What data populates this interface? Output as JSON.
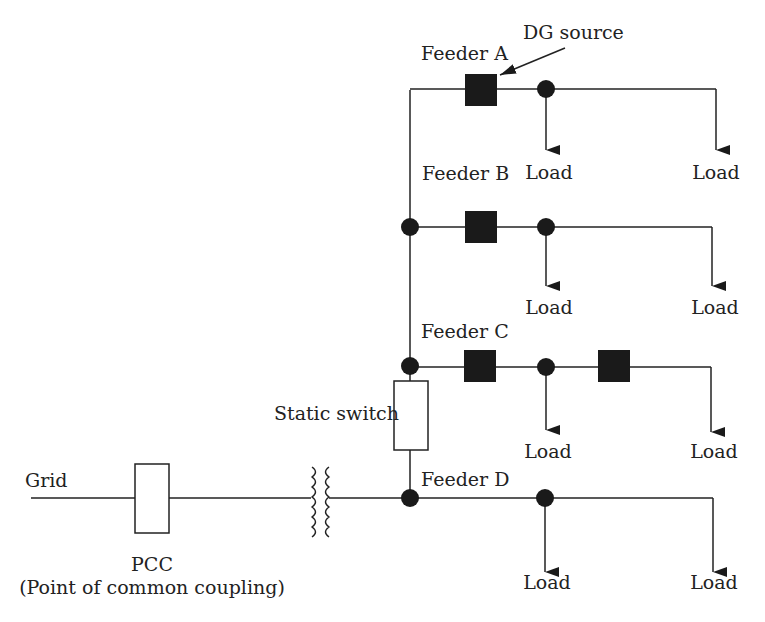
{
  "diagram": {
    "type": "microgrid-single-line",
    "colors": {
      "line": "#222222",
      "fill": "#1a1a1a",
      "background": "#ffffff"
    },
    "labels": {
      "grid": "Grid",
      "pcc": "PCC",
      "pcc_full": "(Point of common coupling)",
      "static_switch": "Static switch",
      "dg_source": "DG source",
      "load": "Load"
    },
    "feeders": [
      {
        "id": "A",
        "label": "Feeder A",
        "dg_sources": 1,
        "loads": [
          "Load",
          "Load"
        ]
      },
      {
        "id": "B",
        "label": "Feeder B",
        "dg_sources": 1,
        "loads": [
          "Load",
          "Load"
        ]
      },
      {
        "id": "C",
        "label": "Feeder C",
        "dg_sources": 2,
        "loads": [
          "Load",
          "Load"
        ]
      },
      {
        "id": "D",
        "label": "Feeder D",
        "dg_sources": 0,
        "loads": [
          "Load",
          "Load"
        ]
      }
    ],
    "components": {
      "transformer": "transformer-icon",
      "pcc_breaker": "breaker-box",
      "static_switch": "switch-box",
      "dg": "dg-source-square",
      "bus_node": "bus-node-dot",
      "load_arrow": "load-arrow"
    }
  }
}
